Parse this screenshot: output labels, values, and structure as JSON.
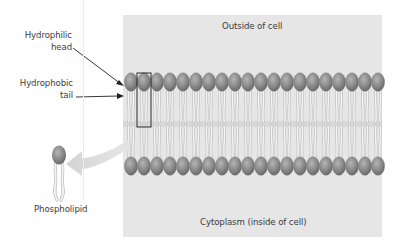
{
  "diagram": {
    "regions": {
      "outside": "Outside of cell",
      "inside": "Cytoplasm (inside of cell)"
    },
    "labels": {
      "head_line1": "Hydrophilic",
      "head_line2": "head",
      "tail_line1": "Hydrophobic",
      "tail_line2": "tail",
      "molecule": "Phospholipid"
    },
    "bilayer": {
      "head_count_per_layer": 20,
      "highlighted_index": 1
    },
    "colors": {
      "background": "#ffffff",
      "membrane_panel": "#e6e6e6",
      "head_fill": "#8a8a8a",
      "head_highlight": "#b2b2b2",
      "tail": "#f4f4f4",
      "tail_stroke": "#bdbdbd",
      "arrow": "#222222",
      "big_arrow": "#d6d6d6",
      "text": "#3c3c3c"
    }
  }
}
